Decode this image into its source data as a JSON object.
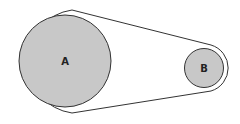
{
  "diagram": {
    "type": "belt-pulley",
    "pulleys": [
      {
        "label": "A",
        "cx": 65,
        "cy": 61,
        "r": 46
      },
      {
        "label": "B",
        "cx": 204,
        "cy": 68,
        "r": 19.5
      }
    ],
    "colors": {
      "pulley_fill": "#c8c8c8",
      "stroke": "#333333",
      "background": "#ffffff"
    }
  }
}
